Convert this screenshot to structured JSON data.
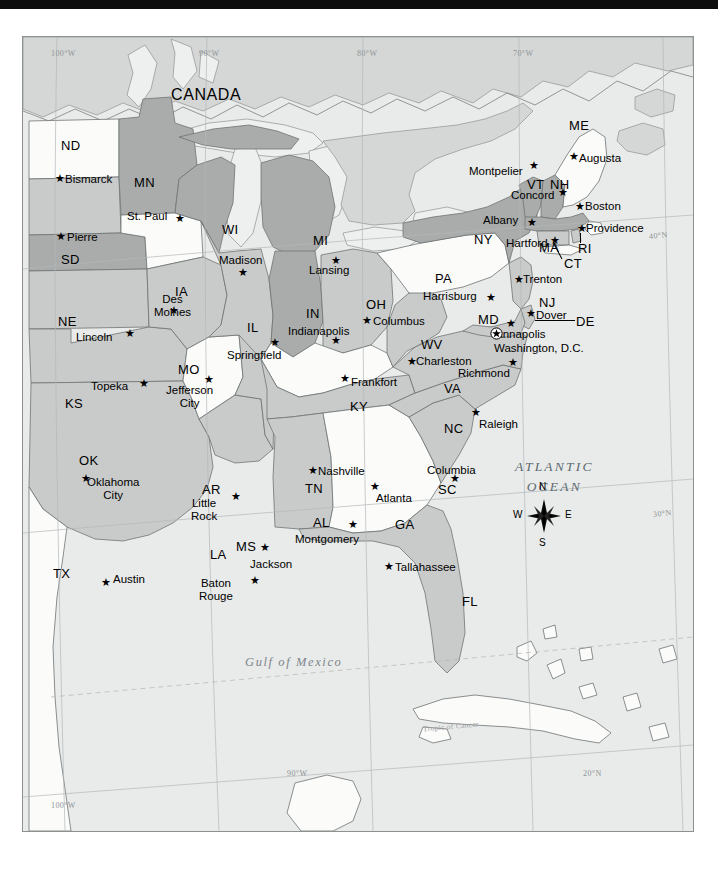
{
  "meta": {
    "black_bar": true
  },
  "colors": {
    "ocean": "#e9ebea",
    "land_light": "#fbfbfa",
    "land_mid": "#c9cbca",
    "land_dark": "#a9acab",
    "canada": "#d5d7d6",
    "border": "#6f7473",
    "graticule": "#a9aeb0",
    "text": "#000000",
    "ocean_text": "#5d6a70"
  },
  "country_labels": [
    {
      "name": "CANADA",
      "x": 148,
      "y": 49
    }
  ],
  "ocean_labels": [
    {
      "name": "ATLANTIC OCEAN",
      "line1": "ATLANTIC",
      "line2": "OCEAN",
      "x": 492,
      "y": 420
    },
    {
      "name": "Gulf of Mexico",
      "x": 222,
      "y": 618
    }
  ],
  "graticule": {
    "top_labels": [
      {
        "text": "100°W",
        "x": 28,
        "y": 12
      },
      {
        "text": "90°W",
        "x": 176,
        "y": 12
      },
      {
        "text": "80°W",
        "x": 334,
        "y": 12
      },
      {
        "text": "70°W",
        "x": 490,
        "y": 12
      }
    ],
    "bottom_labels": [
      {
        "text": "100°W",
        "x": 28,
        "y": 764
      },
      {
        "text": "90°W",
        "x": 264,
        "y": 732
      },
      {
        "text": "20°N",
        "x": 560,
        "y": 732
      }
    ],
    "right_labels": [
      {
        "text": "40°N",
        "x": 626,
        "y": 194
      },
      {
        "text": "30°N",
        "x": 630,
        "y": 472
      }
    ],
    "tropic_label": {
      "text": "Tropic of Cancer",
      "x": 400,
      "y": 685
    }
  },
  "compass": {
    "name": "compass-rose",
    "north": "N",
    "south": "S",
    "east": "E",
    "west": "W",
    "x": 520,
    "y": 478
  },
  "dc": {
    "label": "Washington, D.C.",
    "x": 479,
    "y": 303
  },
  "states": [
    {
      "abbr": "ND",
      "label_x": 38,
      "label_y": 101,
      "capital": "Bismarck",
      "cap_label_x": 42,
      "cap_label_y": 136,
      "star_x": 32,
      "star_y": 136,
      "shade": "light"
    },
    {
      "abbr": "SD",
      "label_x": 38,
      "label_y": 215,
      "capital": "Pierre",
      "cap_label_x": 44,
      "cap_label_y": 194,
      "star_x": 33,
      "star_y": 194,
      "shade": "dark"
    },
    {
      "abbr": "NE",
      "label_x": 35,
      "label_y": 277,
      "capital": "Lincoln",
      "cap_label_x": 53,
      "cap_label_y": 294,
      "star_x": 102,
      "star_y": 291,
      "shade": "dark"
    },
    {
      "abbr": "KS",
      "label_x": 42,
      "label_y": 359,
      "capital": "Topeka",
      "cap_label_x": 68,
      "cap_label_y": 343,
      "star_x": 116,
      "star_y": 341,
      "shade": "mid"
    },
    {
      "abbr": "OK",
      "label_x": 56,
      "label_y": 416,
      "capital": "Oklahoma City",
      "cap_label_x": 64,
      "cap_label_y": 439,
      "cap_line2": "City",
      "star_x": 58,
      "star_y": 436,
      "shade": "mid"
    },
    {
      "abbr": "TX",
      "label_x": 30,
      "label_y": 529,
      "capital": "Austin",
      "cap_label_x": 90,
      "cap_label_y": 536,
      "star_x": 78,
      "star_y": 540,
      "shade": "mid"
    },
    {
      "abbr": "MN",
      "label_x": 111,
      "label_y": 138,
      "capital": "St. Paul",
      "cap_label_x": 104,
      "cap_label_y": 173,
      "star_x": 152,
      "star_y": 176,
      "shade": "dark"
    },
    {
      "abbr": "IA",
      "label_x": 152,
      "label_y": 247,
      "capital": "Des Moines",
      "cap_label_x": 131,
      "cap_label_y": 256,
      "cap_line2": "Moines",
      "star_x": 146,
      "star_y": 268,
      "shade": "light"
    },
    {
      "abbr": "MO",
      "label_x": 155,
      "label_y": 325,
      "capital": "Jefferson City",
      "cap_label_x": 143,
      "cap_label_y": 347,
      "cap_line2": "City",
      "star_x": 181,
      "star_y": 337,
      "shade": "mid"
    },
    {
      "abbr": "AR",
      "label_x": 179,
      "label_y": 445,
      "capital": "Little Rock",
      "cap_label_x": 168,
      "cap_label_y": 460,
      "cap_line2": "Rock",
      "star_x": 208,
      "star_y": 454,
      "shade": "light"
    },
    {
      "abbr": "LA",
      "label_x": 187,
      "label_y": 510,
      "capital": "Baton Rouge",
      "cap_label_x": 176,
      "cap_label_y": 540,
      "cap_line2": "Rouge",
      "star_x": 227,
      "star_y": 538,
      "shade": "mid"
    },
    {
      "abbr": "WI",
      "label_x": 199,
      "label_y": 185,
      "capital": "Madison",
      "cap_label_x": 196,
      "cap_label_y": 217,
      "star_x": 215,
      "star_y": 230,
      "shade": "dark"
    },
    {
      "abbr": "IL",
      "label_x": 224,
      "label_y": 283,
      "capital": "Springfield",
      "cap_label_x": 204,
      "cap_label_y": 312,
      "star_x": 247,
      "star_y": 300,
      "shade": "mid"
    },
    {
      "abbr": "MS",
      "label_x": 213,
      "label_y": 502,
      "capital": "Jackson",
      "cap_label_x": 227,
      "cap_label_y": 521,
      "star_x": 237,
      "star_y": 505,
      "shade": "mid"
    },
    {
      "abbr": "MI",
      "label_x": 290,
      "label_y": 196,
      "capital": "Lansing",
      "cap_label_x": 286,
      "cap_label_y": 227,
      "star_x": 308,
      "star_y": 218,
      "shade": "dark"
    },
    {
      "abbr": "IN",
      "label_x": 283,
      "label_y": 269,
      "capital": "Indianapolis",
      "cap_label_x": 265,
      "cap_label_y": 288,
      "star_x": 308,
      "star_y": 298,
      "shade": "dark"
    },
    {
      "abbr": "KY",
      "label_x": 327,
      "label_y": 362,
      "capital": "Frankfort",
      "cap_label_x": 328,
      "cap_label_y": 339,
      "star_x": 317,
      "star_y": 336,
      "shade": "light"
    },
    {
      "abbr": "TN",
      "label_x": 282,
      "label_y": 444,
      "capital": "Nashville",
      "cap_label_x": 295,
      "cap_label_y": 428,
      "star_x": 285,
      "star_y": 428,
      "shade": "mid"
    },
    {
      "abbr": "AL",
      "label_x": 290,
      "label_y": 478,
      "capital": "Montgomery",
      "cap_label_x": 272,
      "cap_label_y": 496,
      "star_x": 325,
      "star_y": 482,
      "shade": "mid"
    },
    {
      "abbr": "OH",
      "label_x": 343,
      "label_y": 260,
      "capital": "Columbus",
      "cap_label_x": 350,
      "cap_label_y": 278,
      "star_x": 339,
      "star_y": 278,
      "shade": "mid"
    },
    {
      "abbr": "GA",
      "label_x": 372,
      "label_y": 480,
      "capital": "Atlanta",
      "cap_label_x": 353,
      "cap_label_y": 455,
      "star_x": 347,
      "star_y": 444,
      "shade": "light"
    },
    {
      "abbr": "FL",
      "label_x": 439,
      "label_y": 557,
      "capital": "Tallahassee",
      "cap_label_x": 372,
      "cap_label_y": 524,
      "star_x": 361,
      "star_y": 524,
      "shade": "mid"
    },
    {
      "abbr": "WV",
      "label_x": 398,
      "label_y": 300,
      "capital": "Charleston",
      "cap_label_x": 393,
      "cap_label_y": 318,
      "star_x": 384,
      "star_y": 319,
      "shade": "mid"
    },
    {
      "abbr": "VA",
      "label_x": 421,
      "label_y": 344,
      "capital": "Richmond",
      "cap_label_x": 435,
      "cap_label_y": 330,
      "star_x": 485,
      "star_y": 320,
      "shade": "mid"
    },
    {
      "abbr": "NC",
      "label_x": 421,
      "label_y": 384,
      "capital": "Raleigh",
      "cap_label_x": 456,
      "cap_label_y": 381,
      "star_x": 448,
      "star_y": 370,
      "shade": "mid"
    },
    {
      "abbr": "SC",
      "label_x": 415,
      "label_y": 445,
      "capital": "Columbia",
      "cap_label_x": 404,
      "cap_label_y": 427,
      "star_x": 427,
      "star_y": 436,
      "shade": "mid"
    },
    {
      "abbr": "PA",
      "label_x": 412,
      "label_y": 234,
      "capital": "Harrisburg",
      "cap_label_x": 400,
      "cap_label_y": 253,
      "star_x": 463,
      "star_y": 255,
      "shade": "light"
    },
    {
      "abbr": "NY",
      "label_x": 451,
      "label_y": 195,
      "capital": "Albany",
      "cap_label_x": 460,
      "cap_label_y": 177,
      "star_x": 504,
      "star_y": 180,
      "shade": "dark"
    },
    {
      "abbr": "VT",
      "label_x": 504,
      "label_y": 140,
      "capital": "Montpelier",
      "cap_label_x": 446,
      "cap_label_y": 128,
      "star_x": 506,
      "star_y": 123,
      "shade": "dark"
    },
    {
      "abbr": "NH",
      "label_x": 527,
      "label_y": 140,
      "capital": "Concord",
      "cap_label_x": 488,
      "cap_label_y": 152,
      "star_x": 535,
      "star_y": 150,
      "shade": "dark"
    },
    {
      "abbr": "ME",
      "label_x": 546,
      "label_y": 81,
      "capital": "Augusta",
      "cap_label_x": 556,
      "cap_label_y": 115,
      "star_x": 546,
      "star_y": 114,
      "shade": "light"
    },
    {
      "abbr": "MA",
      "label_x": 516,
      "label_y": 203,
      "capital": "Boston",
      "cap_label_x": 562,
      "cap_label_y": 163,
      "star_x": 552,
      "star_y": 164,
      "shade": "dark"
    },
    {
      "abbr": "RI",
      "label_x": 555,
      "label_y": 204,
      "capital": "Providence",
      "cap_label_x": 563,
      "cap_label_y": 185,
      "star_x": 554,
      "star_y": 186,
      "shade": "mid"
    },
    {
      "abbr": "CT",
      "label_x": 541,
      "label_y": 219,
      "capital": "Hartford",
      "cap_label_x": 483,
      "cap_label_y": 200,
      "star_x": 527,
      "star_y": 198,
      "shade": "mid"
    },
    {
      "abbr": "NJ",
      "label_x": 516,
      "label_y": 258,
      "capital": "Trenton",
      "cap_label_x": 500,
      "cap_label_y": 236,
      "star_x": 491,
      "star_y": 237,
      "shade": "mid"
    },
    {
      "abbr": "DE",
      "label_x": 553,
      "label_y": 277,
      "capital": "Dover",
      "cap_label_x": 513,
      "cap_label_y": 272,
      "star_x": 503,
      "star_y": 271,
      "shade": "mid"
    },
    {
      "abbr": "MD",
      "label_x": 455,
      "label_y": 275,
      "capital": "Annapolis",
      "cap_label_x": 472,
      "cap_label_y": 291,
      "star_x": 483,
      "star_y": 281,
      "shade": "mid"
    }
  ]
}
